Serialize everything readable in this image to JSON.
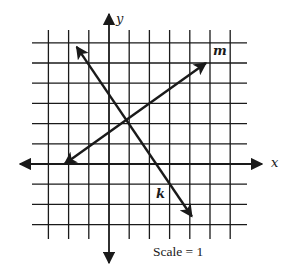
{
  "diagram": {
    "type": "coordinate-plane",
    "axes": {
      "x_label": "x",
      "y_label": "y"
    },
    "grid": {
      "x_min": -4,
      "x_max": 7,
      "y_min": -4,
      "y_max": 6,
      "vertical_lines": [
        -3,
        -2,
        -1,
        0,
        1,
        2,
        3,
        4,
        5,
        6
      ],
      "horizontal_lines": [
        6,
        5,
        4,
        3,
        2,
        1,
        0,
        -1,
        -2,
        -3
      ]
    },
    "lines": [
      {
        "name": "k",
        "label": "k",
        "from": [
          -1.6,
          5.8
        ],
        "to": [
          4.1,
          -2.6
        ]
      },
      {
        "name": "m",
        "label": "m",
        "from": [
          -2.2,
          0
        ],
        "to": [
          4.8,
          5.0
        ]
      }
    ],
    "caption": "Scale = 1",
    "colors": {
      "ink": "#1a1a1a",
      "background": "#ffffff"
    }
  }
}
